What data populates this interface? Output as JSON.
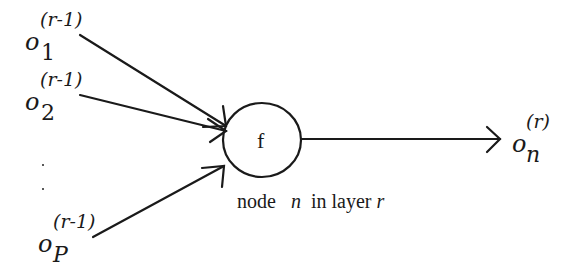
{
  "diagram": {
    "type": "neural-network-node",
    "inputs": [
      {
        "base": "o",
        "subscript": "1",
        "superscript": "(r-1)"
      },
      {
        "base": "o",
        "subscript": "2",
        "superscript": "(r-1)"
      },
      {
        "base": "o",
        "subscript": "P",
        "superscript": "(r-1)"
      }
    ],
    "ellipsis": "·  ·",
    "node": {
      "function_label": "f"
    },
    "output": {
      "base": "o",
      "subscript": "n",
      "superscript": "(r)"
    },
    "caption": {
      "word1": "node",
      "var_n": "n",
      "word2": "in layer",
      "var_r": "r"
    },
    "colors": {
      "stroke": "#1a1a1a",
      "background": "#ffffff"
    }
  }
}
